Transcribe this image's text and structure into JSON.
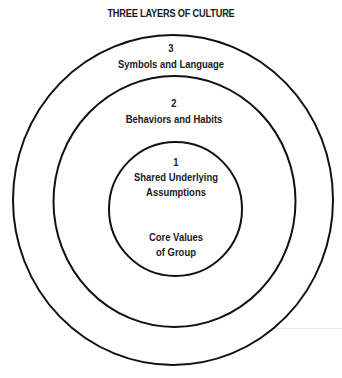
{
  "title": "THREE LAYERS OF CULTURE",
  "layers": [
    {
      "number": "1",
      "label_line1": "Shared Underlying",
      "label_line2": "Assumptions",
      "sub_line1": "Core Values",
      "sub_line2": "of Group"
    },
    {
      "number": "2",
      "label": "Behaviors and Habits"
    },
    {
      "number": "3",
      "label": "Symbols and Language"
    }
  ],
  "colors": {
    "stroke": "#111111",
    "background": "#ffffff",
    "text": "#1a1a1a"
  }
}
